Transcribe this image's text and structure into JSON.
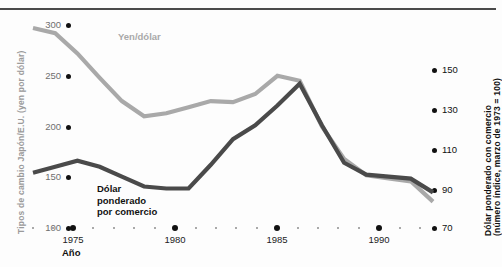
{
  "figure": {
    "left_axis_title": "Tipos de cambio Japón/E.U. (yen por dólar)",
    "right_axis_title_line1": "Dólar ponderado con comercio",
    "right_axis_title_line2": "(número índice, marzo de 1973 = 100)",
    "x_axis_label": "Año",
    "series_label_yen": "Yen/dólar",
    "series_label_dolar": "Dólar\nponderado\npor comercio"
  },
  "colors": {
    "yen_line": "#a9a9a9",
    "dolar_line": "#4a4a4a",
    "left_tick_text": "#6f6f6f",
    "right_tick_text": "#111111",
    "dot": "#111111",
    "minor_dot": "#8d8d8d",
    "rule": "#4a4a4a"
  },
  "chart_data": {
    "type": "line",
    "title": "",
    "xlabel": "Año",
    "ylabel": "Tipos de cambio Japón/E.U. (yen por dólar)",
    "y2label": "Dólar ponderado con comercio (número índice, marzo de 1973 = 100)",
    "grid": false,
    "legend": "inline-annotations",
    "xlim": [
      1973,
      1991
    ],
    "ylim": [
      100,
      300
    ],
    "y2lim": [
      70,
      150
    ],
    "x_major_ticks": [
      1975,
      1980,
      1985,
      1990
    ],
    "x_minor_ticks": [
      1973,
      1974,
      1976,
      1977,
      1978,
      1979,
      1981,
      1982,
      1983,
      1984,
      1986,
      1987,
      1988,
      1989,
      1991
    ],
    "y_ticks": [
      100,
      150,
      200,
      250,
      300
    ],
    "y2_ticks": [
      70,
      90,
      110,
      130,
      150
    ],
    "x": [
      1973,
      1974,
      1975,
      1976,
      1977,
      1978,
      1979,
      1980,
      1981,
      1982,
      1983,
      1984,
      1985,
      1986,
      1987,
      1988,
      1989,
      1990,
      1991
    ],
    "series": [
      {
        "name": "Yen/dólar",
        "axis": "left",
        "color": "#a9a9a9",
        "values": [
          297,
          292,
          272,
          248,
          225,
          210,
          213,
          219,
          225,
          224,
          232,
          250,
          245,
          200,
          168,
          152,
          149,
          146,
          126
        ]
      },
      {
        "name": "Dólar ponderado por comercio",
        "axis": "right",
        "color": "#4a4a4a",
        "values": [
          98,
          101,
          104,
          101,
          96,
          91,
          90,
          90,
          102,
          115,
          122,
          132,
          143,
          122,
          103,
          97,
          96,
          95,
          88
        ]
      }
    ]
  },
  "ticks": {
    "y_left": [
      {
        "label": "300",
        "y": 25
      },
      {
        "label": "250",
        "y": 76
      },
      {
        "label": "200",
        "y": 127
      },
      {
        "label": "150",
        "y": 177
      },
      {
        "label": "100",
        "y": 228
      }
    ],
    "y_right": [
      {
        "label": "150",
        "y": 70
      },
      {
        "label": "130",
        "y": 110
      },
      {
        "label": "110",
        "y": 150
      },
      {
        "label": "90",
        "y": 190
      },
      {
        "label": "70",
        "y": 228
      }
    ],
    "x_major": [
      {
        "label": "1975",
        "x": 73
      },
      {
        "label": "1980",
        "x": 175
      },
      {
        "label": "1985",
        "x": 277
      },
      {
        "label": "1990",
        "x": 379
      }
    ],
    "x_minor_x": [
      33,
      53,
      93,
      114,
      134,
      155,
      196,
      216,
      236,
      257,
      298,
      318,
      338,
      359,
      400,
      420
    ]
  }
}
